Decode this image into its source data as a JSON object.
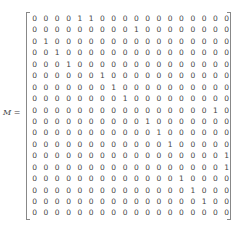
{
  "label": {
    "name": "M",
    "equals": " ="
  },
  "matrix": {
    "rows": 18,
    "cols": 18,
    "values": [
      [
        0,
        0,
        0,
        0,
        1,
        1,
        0,
        0,
        0,
        0,
        0,
        0,
        0,
        0,
        0,
        0,
        0,
        0
      ],
      [
        0,
        0,
        0,
        0,
        0,
        0,
        0,
        0,
        0,
        1,
        0,
        0,
        0,
        0,
        0,
        0,
        0,
        0
      ],
      [
        0,
        1,
        0,
        0,
        0,
        0,
        0,
        0,
        0,
        0,
        0,
        0,
        0,
        0,
        0,
        0,
        0,
        0
      ],
      [
        0,
        0,
        1,
        0,
        0,
        0,
        0,
        0,
        0,
        0,
        0,
        0,
        0,
        0,
        0,
        0,
        0,
        0
      ],
      [
        0,
        0,
        0,
        1,
        0,
        0,
        0,
        0,
        0,
        0,
        0,
        0,
        0,
        0,
        0,
        0,
        0,
        0
      ],
      [
        0,
        0,
        0,
        0,
        0,
        0,
        1,
        0,
        0,
        0,
        0,
        0,
        0,
        0,
        0,
        0,
        0,
        0
      ],
      [
        0,
        0,
        0,
        0,
        0,
        0,
        0,
        1,
        0,
        0,
        0,
        0,
        0,
        0,
        0,
        0,
        0,
        0
      ],
      [
        0,
        0,
        0,
        0,
        0,
        0,
        0,
        0,
        1,
        0,
        0,
        0,
        0,
        0,
        0,
        0,
        0,
        0
      ],
      [
        0,
        0,
        0,
        0,
        0,
        0,
        0,
        0,
        0,
        0,
        0,
        0,
        0,
        0,
        0,
        0,
        1,
        0
      ],
      [
        0,
        0,
        0,
        0,
        0,
        0,
        0,
        0,
        0,
        0,
        1,
        0,
        0,
        0,
        0,
        0,
        0,
        0
      ],
      [
        0,
        0,
        0,
        0,
        0,
        0,
        0,
        0,
        0,
        0,
        0,
        1,
        0,
        0,
        0,
        0,
        0,
        0
      ],
      [
        0,
        0,
        0,
        0,
        0,
        0,
        0,
        0,
        0,
        0,
        0,
        0,
        1,
        0,
        0,
        0,
        0,
        0
      ],
      [
        0,
        0,
        0,
        0,
        0,
        0,
        0,
        0,
        0,
        0,
        0,
        0,
        0,
        0,
        0,
        0,
        0,
        1
      ],
      [
        0,
        0,
        0,
        0,
        0,
        0,
        0,
        0,
        0,
        0,
        0,
        0,
        0,
        0,
        0,
        0,
        0,
        1
      ],
      [
        0,
        0,
        0,
        0,
        0,
        0,
        0,
        0,
        0,
        0,
        0,
        0,
        0,
        1,
        0,
        0,
        0,
        0
      ],
      [
        0,
        0,
        0,
        0,
        0,
        0,
        0,
        0,
        0,
        0,
        0,
        0,
        0,
        0,
        1,
        0,
        0,
        0
      ],
      [
        0,
        0,
        0,
        0,
        0,
        0,
        0,
        0,
        0,
        0,
        0,
        0,
        0,
        0,
        0,
        1,
        0,
        0
      ],
      [
        0,
        0,
        0,
        0,
        0,
        0,
        0,
        0,
        0,
        0,
        0,
        0,
        0,
        0,
        0,
        0,
        0,
        0
      ]
    ]
  }
}
